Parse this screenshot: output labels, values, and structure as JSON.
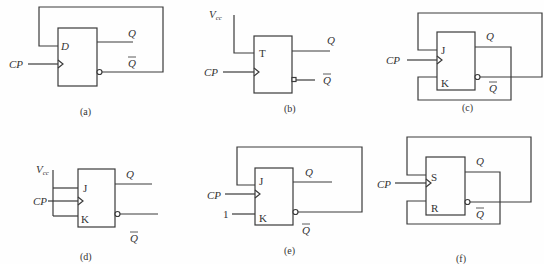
{
  "figure": {
    "circuits": [
      {
        "id": "a",
        "caption": "(a)",
        "type": "D flip-flop",
        "inputs": [
          "D"
        ],
        "clock": "CP",
        "outputs": [
          "Q",
          "Q̄"
        ],
        "feedback": "Q̄ → D"
      },
      {
        "id": "b",
        "caption": "(b)",
        "type": "T flip-flop",
        "inputs": [
          "T"
        ],
        "clock": "CP",
        "supply": "Vcc",
        "outputs": [
          "Q",
          "Q̄"
        ],
        "connection": "Vcc → T"
      },
      {
        "id": "c",
        "caption": "(c)",
        "type": "JK flip-flop",
        "inputs": [
          "J",
          "K"
        ],
        "clock": "CP",
        "outputs": [
          "Q",
          "Q̄"
        ],
        "feedback": "Q̄ → J, Q → K"
      },
      {
        "id": "d",
        "caption": "(d)",
        "type": "JK flip-flop",
        "inputs": [
          "J",
          "K"
        ],
        "clock": "CP",
        "supply": "Vcc",
        "outputs": [
          "Q",
          "Q̄"
        ],
        "connection": "Vcc → J, K"
      },
      {
        "id": "e",
        "caption": "(e)",
        "type": "JK flip-flop",
        "inputs": [
          "J",
          "K"
        ],
        "clock": "CP",
        "constant": "1",
        "outputs": [
          "Q",
          "Q̄"
        ],
        "feedback": "Q̄ → J, 1 → K"
      },
      {
        "id": "f",
        "caption": "(f)",
        "type": "SR flip-flop",
        "inputs": [
          "S",
          "R"
        ],
        "clock": "CP",
        "outputs": [
          "Q",
          "Q̄"
        ],
        "feedback": "Q̄ → S, Q → R"
      }
    ]
  },
  "labels": {
    "cp": "CP",
    "q": "Q",
    "qbar": "Q",
    "d": "D",
    "t": "T",
    "j": "J",
    "k": "K",
    "s": "S",
    "r": "R",
    "v": "V",
    "vcc_sub": "cc",
    "one": "1"
  },
  "captions": {
    "a": "(a)",
    "b": "(b)",
    "c": "(c)",
    "d": "(d)",
    "e": "(e)",
    "f": "(f)"
  }
}
